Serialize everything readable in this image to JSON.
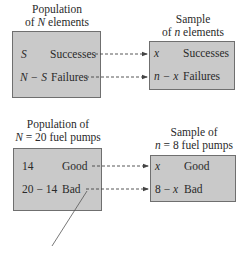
{
  "general": {
    "left_heading_line1": "Population",
    "left_heading_line2_prefix": "of ",
    "left_heading_var": "N",
    "left_heading_line2_suffix": " elements",
    "right_heading_line1": "Sample",
    "right_heading_line2_prefix": "of ",
    "right_heading_var": "n",
    "right_heading_line2_suffix": " elements",
    "population_rows": [
      {
        "count": "S",
        "label": "Successes"
      },
      {
        "count": "N − S",
        "label": "Failures"
      }
    ],
    "sample_rows": [
      {
        "count": "x",
        "label": "Successes"
      },
      {
        "count": "n − x",
        "label": "Failures"
      }
    ]
  },
  "example": {
    "left_heading_line1": "Population of",
    "left_heading_line2": "N = 20 fuel pumps",
    "left_heading_var": "N",
    "left_heading_rest": " = 20 fuel pumps",
    "right_heading_line1": "Sample of",
    "right_heading_var": "n",
    "right_heading_rest": " = 8 fuel pumps",
    "population_rows": [
      {
        "count": "14",
        "label": "Good"
      },
      {
        "count": "20 − 14",
        "label": "Bad"
      }
    ],
    "sample_rows": [
      {
        "count": "x",
        "label": "Good"
      },
      {
        "count": "8 − ",
        "count_var": "x",
        "label": "Bad"
      }
    ]
  },
  "colors": {
    "box_fill": "#c9c9c9",
    "box_border": "#6f6f6f",
    "arrow": "#444444"
  }
}
